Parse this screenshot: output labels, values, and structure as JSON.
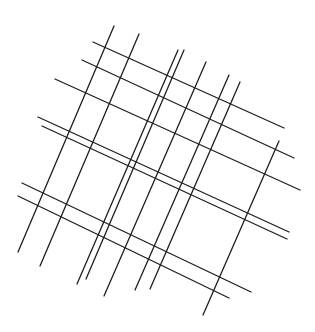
{
  "drawing": {
    "description": "Abstract line grid: two families of crossing straight lines on white background",
    "background": "#ffffff",
    "stroke_color": "#1e1e1e",
    "steep_lines": [
      {
        "x1": 114,
        "y1": 26,
        "x2": 18,
        "y2": 252
      },
      {
        "x1": 139,
        "y1": 34,
        "x2": 40,
        "y2": 266
      },
      {
        "x1": 178,
        "y1": 50,
        "x2": 77,
        "y2": 284
      },
      {
        "x1": 184,
        "y1": 50,
        "x2": 86,
        "y2": 279
      },
      {
        "x1": 206,
        "y1": 62,
        "x2": 104,
        "y2": 296
      },
      {
        "x1": 229,
        "y1": 75,
        "x2": 135,
        "y2": 290
      },
      {
        "x1": 240,
        "y1": 82,
        "x2": 150,
        "y2": 289
      },
      {
        "x1": 279,
        "y1": 141,
        "x2": 203,
        "y2": 315
      }
    ],
    "shallow_lines": [
      {
        "x1": 93,
        "y1": 42,
        "x2": 284,
        "y2": 128
      },
      {
        "x1": 82,
        "y1": 60,
        "x2": 294,
        "y2": 158
      },
      {
        "x1": 55,
        "y1": 79,
        "x2": 300,
        "y2": 190
      },
      {
        "x1": 38,
        "y1": 117,
        "x2": 289,
        "y2": 232
      },
      {
        "x1": 42,
        "y1": 126,
        "x2": 287,
        "y2": 239
      },
      {
        "x1": 22,
        "y1": 183,
        "x2": 251,
        "y2": 292
      },
      {
        "x1": 18,
        "y1": 196,
        "x2": 229,
        "y2": 298
      }
    ]
  }
}
